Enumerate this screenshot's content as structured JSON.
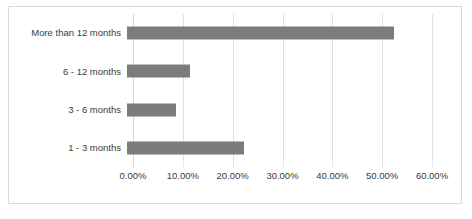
{
  "chart_data": {
    "type": "bar",
    "orientation": "horizontal",
    "title": "",
    "xlabel": "",
    "ylabel": "",
    "categories": [
      "More than 12 months",
      "6 - 12 months",
      "3 - 6 months",
      "1 - 3 months"
    ],
    "values": [
      53.5,
      12.7,
      9.8,
      23.5
    ],
    "value_format": "percent",
    "xlim": [
      0,
      60
    ],
    "xticks": [
      0,
      10,
      20,
      30,
      40,
      50,
      60
    ],
    "xtick_labels": [
      "0.00%",
      "10.00%",
      "20.00%",
      "30.00%",
      "40.00%",
      "50.00%",
      "60.00%"
    ],
    "grid": "vertical",
    "legend": "none",
    "series": [
      {
        "name": "",
        "values": [
          53.5,
          12.7,
          9.8,
          23.5
        ]
      }
    ],
    "colors": {
      "bar": "#7c7c7c",
      "gridline": "#e3e3e3",
      "axis": "#d6d6d6",
      "text": "#3b3b3b",
      "border": "#d9d9d9",
      "background": "#ffffff"
    }
  }
}
